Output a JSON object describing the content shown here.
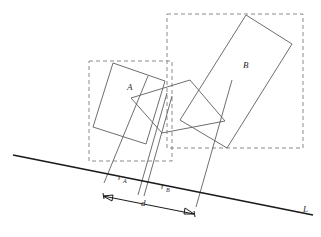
{
  "figure": {
    "kind": "geometry-diagram",
    "canvas": {
      "width": 321,
      "height": 237,
      "background": "#ffffff"
    },
    "colors": {
      "shape_stroke": "#6e6e6e",
      "bbox_stroke": "#8a8a8a",
      "axis_stroke": "#1a1a1a",
      "projection_stroke": "#5f5f5f",
      "label_fill": "#2b2b2b"
    },
    "labels": {
      "shape_a": "A",
      "shape_b": "B",
      "radius_a_base": "r",
      "radius_a_sub": "A",
      "radius_b_base": "r",
      "radius_b_sub": "B",
      "distance": "d",
      "axis": "L"
    },
    "label_positions": {
      "shape_a": {
        "x": 127,
        "y": 90
      },
      "shape_b": {
        "x": 243,
        "y": 68
      },
      "radius_a": {
        "x": 118,
        "y": 180
      },
      "radius_b": {
        "x": 161,
        "y": 189
      },
      "distance": {
        "x": 141,
        "y": 206
      },
      "axis": {
        "x": 303,
        "y": 212
      }
    },
    "axis_line": {
      "name": "separating-axis-L",
      "x1": 13,
      "y1": 155,
      "x2": 313,
      "y2": 215
    },
    "shape_a": {
      "name": "rectangle-a",
      "points": "113,63 165,81 146,144 93,127",
      "bbox": {
        "x": 89,
        "y": 61,
        "width": 83,
        "height": 100
      }
    },
    "shape_b": {
      "name": "rectangle-b",
      "points": "246,15 292,44 227,148 180,120",
      "bbox": {
        "x": 167,
        "y": 14,
        "width": 136,
        "height": 134
      }
    },
    "inner_polygon": {
      "name": "inner-contact-polygon",
      "points": "131,98 190,80 225,121 162,133"
    },
    "projections": [
      {
        "name": "projection-line-a-left",
        "x1": 148,
        "y1": 76,
        "x2": 104,
        "y2": 183
      },
      {
        "name": "projection-line-a-right",
        "x1": 167,
        "y1": 93,
        "x2": 138,
        "y2": 195
      },
      {
        "name": "projection-line-b-left",
        "x1": 172,
        "y1": 96,
        "x2": 144,
        "y2": 196
      },
      {
        "name": "projection-line-b-right",
        "x1": 232,
        "y1": 80,
        "x2": 196,
        "y2": 207
      }
    ],
    "dimension_lines": [
      {
        "name": "radius-a-extent",
        "x1": 104,
        "y1": 183,
        "x2": 138,
        "y2": 190
      },
      {
        "name": "radius-b-extent",
        "x1": 144,
        "y1": 191,
        "x2": 196,
        "y2": 202
      },
      {
        "name": "distance-d",
        "x1": 103,
        "y1": 196,
        "x2": 194,
        "y2": 214
      }
    ],
    "dashed_connectors": [
      {
        "name": "bbox-a-bottom-extension",
        "x1": 89,
        "y1": 161,
        "x2": 172,
        "y2": 161
      },
      {
        "name": "bbox-b-left-extension",
        "x1": 167,
        "y1": 14,
        "x2": 167,
        "y2": 148
      }
    ]
  }
}
